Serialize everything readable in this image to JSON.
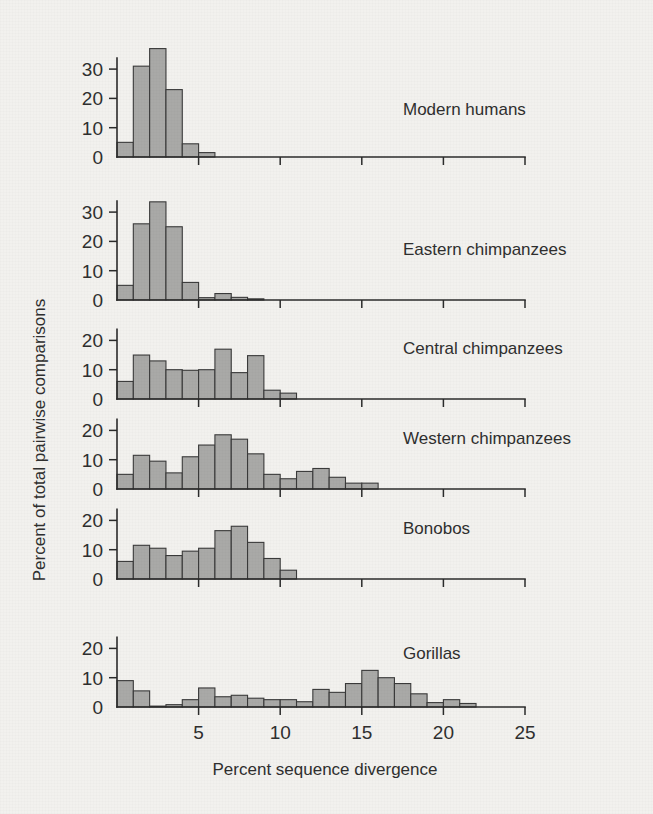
{
  "figure": {
    "background_color": "#f2f1ee",
    "bar_fill_color": "#a9a9a7",
    "bar_stroke_color": "#3a3a3a",
    "axis_color": "#2b2b2b"
  },
  "chart_data": {
    "type": "bar",
    "title": "",
    "xlabel": "Percent sequence divergence",
    "ylabel": "Percent of total pairwise comparisons",
    "xlim": [
      0,
      25
    ],
    "xticks": [
      0,
      5,
      10,
      15,
      20,
      25
    ],
    "xticklabels": [
      "0",
      "5",
      "10",
      "15",
      "20",
      "25"
    ],
    "grid": false,
    "legend": "none",
    "bin_width": 1,
    "panels": [
      {
        "label": "Modern humans",
        "ylim": [
          0,
          38
        ],
        "yticks": [
          0,
          10,
          20,
          30
        ],
        "yticklabels": [
          "0",
          "10",
          "20",
          "30"
        ],
        "bin_starts": [
          0,
          1,
          2,
          3,
          4,
          5
        ],
        "values": [
          5,
          31,
          37,
          23,
          4.5,
          1.5
        ]
      },
      {
        "label": "Eastern chimpanzees",
        "ylim": [
          0,
          38
        ],
        "yticks": [
          0,
          10,
          20,
          30
        ],
        "yticklabels": [
          "0",
          "10",
          "20",
          "30"
        ],
        "bin_starts": [
          0,
          1,
          2,
          3,
          4,
          5,
          6,
          7,
          8
        ],
        "values": [
          5,
          26,
          33.5,
          25,
          6,
          0.8,
          2.2,
          0.9,
          0.4
        ]
      },
      {
        "label": "Central chimpanzees",
        "ylim": [
          0,
          21
        ],
        "yticks": [
          0,
          10,
          20
        ],
        "yticklabels": [
          "0",
          "10",
          "20"
        ],
        "bin_starts": [
          0,
          1,
          2,
          3,
          4,
          5,
          6,
          7,
          8,
          9,
          10,
          11
        ],
        "values": [
          6,
          15,
          13,
          10,
          9.8,
          10,
          17,
          9,
          14.8,
          3,
          2,
          0
        ]
      },
      {
        "label": "Western chimpanzees",
        "ylim": [
          0,
          21
        ],
        "yticks": [
          0,
          10,
          20
        ],
        "yticklabels": [
          "0",
          "10",
          "20"
        ],
        "bin_starts": [
          0,
          1,
          2,
          3,
          4,
          5,
          6,
          7,
          8,
          9,
          10,
          11,
          12,
          13,
          14,
          15
        ],
        "values": [
          5,
          11.5,
          9.5,
          5.5,
          11,
          15,
          18.5,
          17,
          12,
          5,
          3.5,
          6,
          7,
          4,
          2,
          2
        ]
      },
      {
        "label": "Bonobos",
        "ylim": [
          0,
          21
        ],
        "yticks": [
          0,
          10,
          20
        ],
        "yticklabels": [
          "0",
          "10",
          "20"
        ],
        "bin_starts": [
          0,
          1,
          2,
          3,
          4,
          5,
          6,
          7,
          8,
          9,
          10
        ],
        "values": [
          6,
          11.5,
          10.5,
          8,
          9.5,
          10.5,
          16.5,
          18,
          12.5,
          7,
          3
        ]
      },
      {
        "label": "Gorillas",
        "ylim": [
          0,
          21
        ],
        "yticks": [
          0,
          10,
          20
        ],
        "yticklabels": [
          "0",
          "10",
          "20"
        ],
        "bin_starts": [
          0,
          1,
          2,
          3,
          4,
          5,
          6,
          7,
          8,
          9,
          10,
          11,
          12,
          13,
          14,
          15,
          16,
          17,
          18,
          19,
          20,
          21
        ],
        "values": [
          9,
          5.5,
          0.3,
          0.8,
          2.5,
          6.5,
          3.5,
          4,
          3,
          2.5,
          2.5,
          1.8,
          6,
          5,
          8,
          12.5,
          10,
          8,
          4.5,
          1.5,
          2.5,
          1.2
        ]
      }
    ]
  }
}
